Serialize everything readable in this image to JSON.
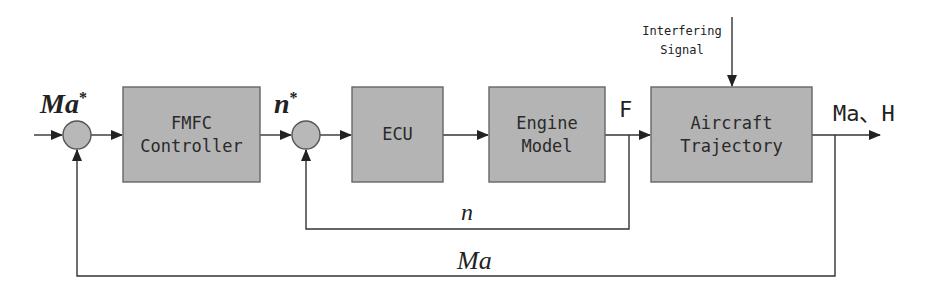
{
  "diagram": {
    "type": "control block diagram",
    "colors": {
      "block_fill": "#b4b4b4",
      "block_stroke": "#666666",
      "line": "#333333",
      "background": "#ffffff"
    },
    "signals": {
      "reference_ma": "Ma",
      "reference_ma_sup": "*",
      "reference_n": "n",
      "reference_n_sup": "*",
      "thrust": "F",
      "output": "Ma、H",
      "feedback_n": "n",
      "feedback_ma": "Ma",
      "disturbance_line1": "Interfering",
      "disturbance_line2": "Signal"
    },
    "blocks": [
      {
        "id": "fmfc",
        "line1": "FMFC",
        "line2": "Controller"
      },
      {
        "id": "ecu",
        "line1": "ECU",
        "line2": ""
      },
      {
        "id": "engine",
        "line1": "Engine",
        "line2": "Model"
      },
      {
        "id": "aircraft",
        "line1": "Aircraft",
        "line2": "Trajectory"
      }
    ],
    "summing_junctions": 2
  }
}
